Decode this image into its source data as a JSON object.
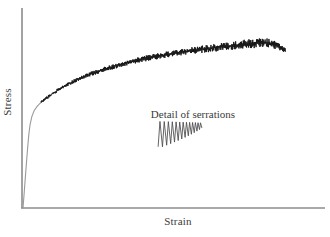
{
  "figure": {
    "background_color": "#ffffff",
    "axis_color": "#8c8c8c",
    "curve_color": "#111111",
    "text_color": "#3b3b3b"
  },
  "axes": {
    "x_label": "Strain",
    "y_label": "Stress"
  },
  "annotations": {
    "detail_caption": "Detail of serrations"
  },
  "chart_data": {
    "type": "line",
    "title": "",
    "subtitle": "",
    "xlabel": "Strain",
    "ylabel": "Stress",
    "xlim": [
      0,
      1
    ],
    "ylim": [
      0,
      1
    ],
    "grid": false,
    "legend": "none",
    "axis_ticks": {
      "x": [],
      "y": []
    },
    "annotations": [
      {
        "text": "Detail of serrations",
        "x": 0.49,
        "y": 0.5,
        "role": "inset-caption"
      }
    ],
    "series": [
      {
        "name": "Serrated stress-strain curve",
        "description": "Elastic rise to yield then serrated (Portevin-Le Chatelier) plastic flow rising to a maximum and falling slightly at fracture",
        "color": "#111111",
        "x": [
          0.0,
          0.004,
          0.008,
          0.012,
          0.016,
          0.02,
          0.024,
          0.03,
          0.038,
          0.048,
          0.06,
          0.075,
          0.095,
          0.12,
          0.15,
          0.185,
          0.22,
          0.26,
          0.3,
          0.345,
          0.39,
          0.435,
          0.48,
          0.525,
          0.57,
          0.615,
          0.66,
          0.7,
          0.74,
          0.775,
          0.805,
          0.83,
          0.85,
          0.865,
          0.875,
          0.885
        ],
        "y": [
          0.0,
          0.085,
          0.175,
          0.262,
          0.345,
          0.42,
          0.47,
          0.515,
          0.548,
          0.572,
          0.592,
          0.612,
          0.636,
          0.663,
          0.692,
          0.722,
          0.746,
          0.77,
          0.79,
          0.812,
          0.83,
          0.845,
          0.858,
          0.87,
          0.881,
          0.891,
          0.9,
          0.907,
          0.914,
          0.92,
          0.925,
          0.922,
          0.912,
          0.9,
          0.888,
          0.88
        ],
        "serration_amplitude": [
          0.0,
          0.0,
          0.0,
          0.0,
          0.0,
          0.0,
          0.002,
          0.004,
          0.006,
          0.008,
          0.01,
          0.012,
          0.013,
          0.014,
          0.015,
          0.016,
          0.017,
          0.018,
          0.019,
          0.02,
          0.021,
          0.022,
          0.023,
          0.024,
          0.026,
          0.028,
          0.03,
          0.032,
          0.034,
          0.036,
          0.036,
          0.034,
          0.03,
          0.026,
          0.022,
          0.018
        ]
      }
    ],
    "inset": {
      "name": "Detail of serrations",
      "type": "sawtooth",
      "teeth": 9,
      "baseline_slope": "rising",
      "amplitude_trend": "decreasing",
      "x_start": 0.455,
      "x_end": 0.585,
      "y_center": 0.405
    }
  }
}
